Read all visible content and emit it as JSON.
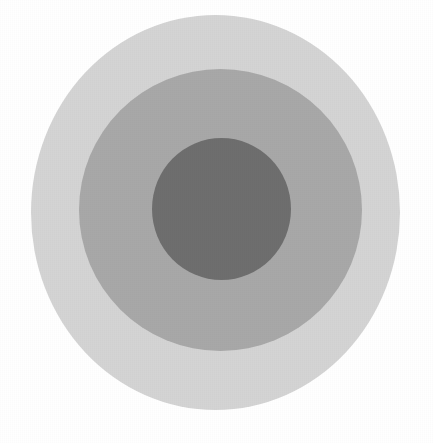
{
  "image": {
    "title": "Concentric circles target figure",
    "description": "Three nested filled gray ellipses on a white background, forming a bullseye / target pattern.",
    "width": 433,
    "height": 443,
    "background_color": "#ffffff",
    "texture": "paper-grain"
  },
  "chart_data": {
    "type": "pie",
    "subtitle": "",
    "xlabel": "",
    "ylabel": "",
    "grid": false,
    "legend_position": "none",
    "shapes": [
      {
        "name": "outer-ring",
        "label": "Outer ring",
        "shape": "ellipse",
        "color": "#d4d4d4",
        "cx": 215.5,
        "cy": 212.5,
        "rx": 184.5,
        "ry": 197.5,
        "bounds": {
          "left": 31,
          "right": 400,
          "top": 15,
          "bottom": 410
        },
        "z": 1
      },
      {
        "name": "middle-ring",
        "label": "Middle ring",
        "shape": "ellipse",
        "color": "#a8a8a8",
        "cx": 220.5,
        "cy": 210.0,
        "rx": 141.5,
        "ry": 141.0,
        "bounds": {
          "left": 79,
          "right": 362,
          "top": 69,
          "bottom": 351
        },
        "z": 2
      },
      {
        "name": "inner-circle",
        "label": "Inner circle",
        "shape": "ellipse",
        "color": "#6e6e6e",
        "cx": 221.5,
        "cy": 209.0,
        "rx": 69.5,
        "ry": 71.0,
        "bounds": {
          "left": 152,
          "right": 291,
          "top": 138,
          "bottom": 280
        },
        "z": 3
      }
    ]
  }
}
